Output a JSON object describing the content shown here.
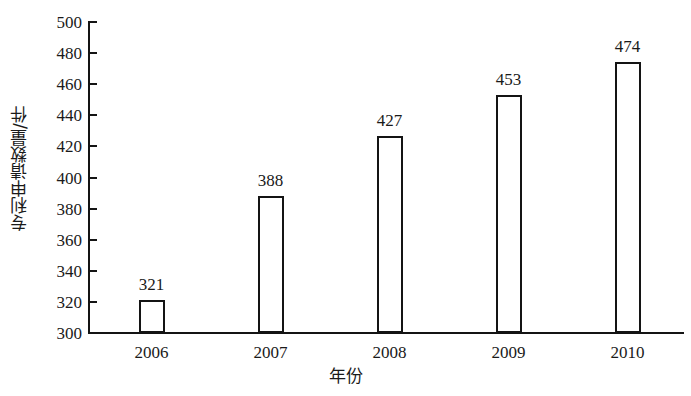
{
  "chart_data": {
    "type": "bar",
    "title": "",
    "categories": [
      "2006",
      "2007",
      "2008",
      "2009",
      "2010"
    ],
    "values": [
      321,
      388,
      427,
      453,
      474
    ],
    "data_labels": [
      "321",
      "388",
      "427",
      "453",
      "474"
    ],
    "xlabel": "年份",
    "ylabel": "专利申请数量/件",
    "ylim": [
      300,
      500
    ],
    "ytick_labels": [
      "300",
      "320",
      "340",
      "360",
      "380",
      "400",
      "420",
      "440",
      "460",
      "480",
      "500"
    ],
    "ytick_values": [
      300,
      320,
      340,
      360,
      380,
      400,
      420,
      440,
      460,
      480,
      500
    ],
    "xtick_labels": [
      "2006",
      "2007",
      "2008",
      "2009",
      "2010"
    ],
    "grid": false,
    "legend": false,
    "legend_position": "none",
    "series": [
      {
        "name": "专利申请数量",
        "values": [
          321,
          388,
          427,
          453,
          474
        ]
      }
    ],
    "colors": {
      "bar_fill": "#ffffff",
      "bar_edge": "#141414",
      "axis": "#141414",
      "text": "#1a1a1a",
      "background": "#ffffff"
    }
  }
}
